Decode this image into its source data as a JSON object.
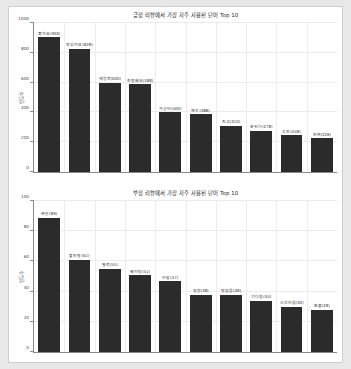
{
  "figure": {
    "background": "#ffffff",
    "page_background": "#e8e8e8",
    "bar_color": "#2b2b2b"
  },
  "chart_data": [
    {
      "type": "bar",
      "title": "긍정 리뷰에서 가장 자주 사용된 단어 Top 10",
      "xlabel": "",
      "ylabel": "빈도수",
      "grid": true,
      "legend": null,
      "ylim": [
        0,
        1000
      ],
      "yticks": [
        0,
        200,
        400,
        600,
        800,
        1000
      ],
      "yticklabels": [
        "0",
        "200",
        "400",
        "600",
        "800",
        "1000"
      ],
      "categories": [
        "좋아요",
        "맛있어요",
        "재방문",
        "친절해요",
        "가성비",
        "깨끗",
        "최고",
        "분위기",
        "추천",
        "만족"
      ],
      "values": [
        903,
        828,
        600,
        588,
        400,
        388,
        310,
        278,
        248,
        228
      ],
      "labels": [
        "좋아요(903)",
        "맛있어요(828)",
        "재방문(600)",
        "친절해요(588)",
        "가성비(400)",
        "깨끗(388)",
        "최고(310)",
        "분위기(278)",
        "추천(248)",
        "만족(228)"
      ]
    },
    {
      "type": "bar",
      "title": "부정 리뷰에서 가장 자주 사용된 단어 Top 10",
      "xlabel": "",
      "ylabel": "빈도수",
      "grid": true,
      "legend": null,
      "ylim": [
        0,
        100
      ],
      "yticks": [
        0,
        20,
        40,
        60,
        80,
        100
      ],
      "yticklabels": [
        "0",
        "20",
        "40",
        "60",
        "80",
        "100"
      ],
      "categories": [
        "배달",
        "불친절",
        "별로",
        "웨이팅",
        "비쌈",
        "실망",
        "맛없음",
        "기다림",
        "시끄러움",
        "환불"
      ],
      "values": [
        89,
        61,
        55,
        51,
        47,
        38,
        38,
        34,
        30,
        28
      ],
      "labels": [
        "배달(89)",
        "불친절(61)",
        "별로(55)",
        "웨이팅(51)",
        "비쌈(47)",
        "실망(38)",
        "맛없음(38)",
        "기다림(34)",
        "시끄러움(30)",
        "환불(28)"
      ]
    }
  ]
}
